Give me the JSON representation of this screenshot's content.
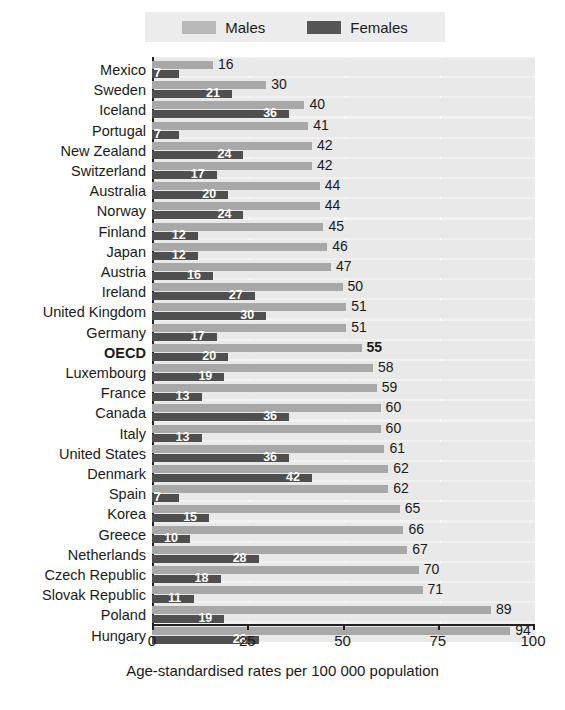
{
  "chart_data": {
    "type": "bar",
    "orientation": "horizontal",
    "title": "",
    "xlabel": "Age-standardised rates per 100 000 population",
    "ylabel": "",
    "xlim": [
      0,
      100
    ],
    "xticks": [
      0,
      25,
      50,
      75,
      100
    ],
    "grid": true,
    "legend_position": "top",
    "categories": [
      "Mexico",
      "Sweden",
      "Iceland",
      "Portugal",
      "New Zealand",
      "Switzerland",
      "Australia",
      "Norway",
      "Finland",
      "Japan",
      "Austria",
      "Ireland",
      "United Kingdom",
      "Germany",
      "OECD",
      "Luxembourg",
      "France",
      "Canada",
      "Italy",
      "United States",
      "Denmark",
      "Spain",
      "Korea",
      "Greece",
      "Netherlands",
      "Czech Republic",
      "Slovak Republic",
      "Poland",
      "Hungary"
    ],
    "series": [
      {
        "name": "Males",
        "color": "#a8a8a8",
        "values": [
          16,
          30,
          40,
          41,
          42,
          42,
          44,
          44,
          45,
          46,
          47,
          50,
          51,
          51,
          55,
          58,
          59,
          60,
          60,
          61,
          62,
          62,
          65,
          66,
          67,
          70,
          71,
          89,
          94
        ]
      },
      {
        "name": "Females",
        "color": "#4f4f4f",
        "values": [
          7,
          21,
          36,
          7,
          24,
          17,
          20,
          24,
          12,
          12,
          16,
          27,
          30,
          17,
          20,
          19,
          13,
          36,
          13,
          36,
          42,
          7,
          15,
          10,
          28,
          18,
          11,
          19,
          28
        ]
      }
    ],
    "highlighted_category": "OECD"
  },
  "legend": {
    "males_label": "Males",
    "females_label": "Females"
  },
  "axis": {
    "tick_labels": [
      "0",
      "25",
      "50",
      "75",
      "100"
    ],
    "caption": "Age-standardised rates per 100 000 population"
  },
  "colors": {
    "male_bar": "#a8a8a8",
    "female_bar": "#4f4f4f",
    "plot_background": "#f1f1f1",
    "legend_background": "#ececec",
    "axis": "#222222",
    "text": "#1a1a1a"
  }
}
